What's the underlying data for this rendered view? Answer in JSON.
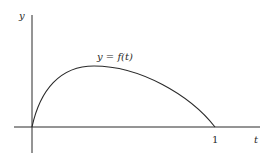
{
  "diagram": {
    "type": "function-graph",
    "y_axis_label": "y",
    "x_axis_label": "t",
    "curve_label": "y = f(t)",
    "x_tick_labels": [
      "1"
    ],
    "curve": {
      "description": "concave-down curve starting at origin, rising steeply to a maximum near t≈0.33, then decreasing to zero at t=1",
      "passes_through": [
        [
          0,
          0
        ],
        [
          1,
          0
        ]
      ]
    },
    "colors": {
      "stroke": "#2a2a2a",
      "background": "#ffffff"
    }
  }
}
